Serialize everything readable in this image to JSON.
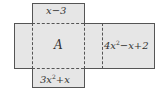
{
  "figure": {
    "type": "cube-net",
    "faces": {
      "top": {
        "label": "x−3"
      },
      "center": {
        "label": "A"
      },
      "right": {
        "label_main": "4x",
        "label_exp": "2",
        "label_tail": "−x+2"
      },
      "bottom": {
        "label_main": "3x",
        "label_exp": "2",
        "label_tail": "+x"
      }
    },
    "colors": {
      "face_fill": "#e6e6e6",
      "edge": "#555555"
    }
  }
}
